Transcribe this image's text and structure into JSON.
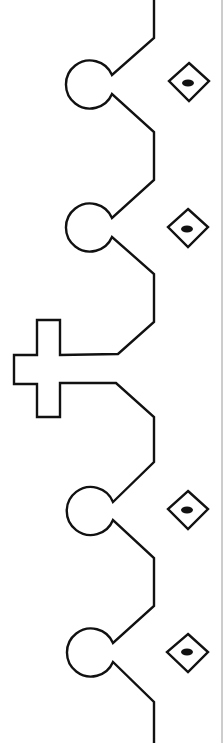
{
  "figure": {
    "type": "line-drawing",
    "colors": {
      "stroke": "#111111",
      "background": "#ffffff",
      "border": "#9a9a9a"
    },
    "main_line_x": 154,
    "lobes": [
      {
        "id": "lobe-1",
        "circle_cy": 84
      },
      {
        "id": "lobe-2",
        "circle_cy": 228
      },
      {
        "id": "lobe-3",
        "circle_cy": 510
      },
      {
        "id": "lobe-4",
        "circle_cy": 652
      }
    ],
    "diamonds": [
      {
        "id": "diamond-1",
        "cy": 81
      },
      {
        "id": "diamond-2",
        "cy": 227
      },
      {
        "id": "diamond-3",
        "cy": 509
      },
      {
        "id": "diamond-4",
        "cy": 652
      }
    ],
    "cross": {
      "id": "cross-protrusion",
      "cy": 370
    }
  }
}
